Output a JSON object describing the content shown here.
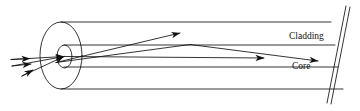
{
  "diagram": {
    "name": "optical-fiber-ray-propagation",
    "type": "schematic",
    "background_color": "#ffffff",
    "stroke_color": "#111111",
    "labels": {
      "cladding": "Cladding",
      "core": "Core"
    },
    "label_positions": {
      "cladding": {
        "x": 289,
        "y": 36
      },
      "core": {
        "x": 292,
        "y": 66
      }
    },
    "geometry": {
      "outer_ellipse": {
        "cx": 61,
        "cy": 55.5,
        "rx": 21,
        "ry": 33.5
      },
      "inner_ellipse": {
        "cx": 64.5,
        "cy": 56.5,
        "rx": 7.5,
        "ry": 11.5
      },
      "cladding_top_line": {
        "x1": 61,
        "y1": 22,
        "x2": 330,
        "y2": 22
      },
      "cladding_bottom_line": {
        "x1": 61,
        "y1": 89,
        "x2": 342,
        "y2": 89
      },
      "core_top_line": {
        "x1": 64,
        "y1": 45,
        "x2": 334,
        "y2": 45
      },
      "core_bottom_line": {
        "x1": 64,
        "y1": 67,
        "x2": 337,
        "y2": 67
      },
      "cut_edge_left": {
        "x1": 326,
        "y1": 103,
        "x2": 346,
        "y2": 6
      },
      "cut_edge_right": {
        "x1": 330,
        "y1": 104,
        "x2": 350,
        "y2": 7
      }
    },
    "rays": [
      {
        "name": "incoming-ray-upper",
        "points": "11,60 64,56",
        "arrow": true
      },
      {
        "name": "incoming-ray-middle",
        "points": "13,66 64,56",
        "arrow": true
      },
      {
        "name": "incoming-ray-lower",
        "points": "22,75 64,56",
        "arrow": true
      },
      {
        "name": "refracted-ray-steep",
        "points": "57,62 180,33",
        "arrow": true
      },
      {
        "name": "refracted-ray-reflected",
        "points": "57,62 190,45 264,58",
        "arrow": true
      },
      {
        "name": "axial-ray",
        "points": "64,56 318,61",
        "arrow": true
      }
    ],
    "arrow_tips": [
      {
        "name": "arrow-tip-incoming-1",
        "x": 30,
        "y": 59
      },
      {
        "name": "arrow-tip-incoming-2",
        "x": 30,
        "y": 64
      },
      {
        "name": "arrow-tip-incoming-3",
        "x": 30,
        "y": 70
      },
      {
        "name": "arrow-tip-steep",
        "x": 180,
        "y": 33
      },
      {
        "name": "arrow-tip-axial",
        "x": 264,
        "y": 58
      },
      {
        "name": "arrow-tip-reflected",
        "x": 318,
        "y": 61
      }
    ]
  }
}
